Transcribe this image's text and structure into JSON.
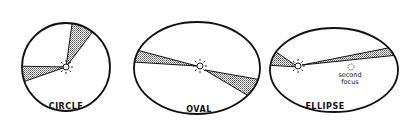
{
  "diagram": {
    "title": "",
    "panels": [
      {
        "id": "circle",
        "label": "CIRCLE"
      },
      {
        "id": "oval",
        "label": "OVAL"
      },
      {
        "id": "ellipse",
        "label": "ELLIPSE",
        "annotation_line1": "second",
        "annotation_line2": "focus"
      }
    ],
    "colors": {
      "stroke": "#111111",
      "shade": "#9a9a9a",
      "background": "#ffffff"
    }
  }
}
